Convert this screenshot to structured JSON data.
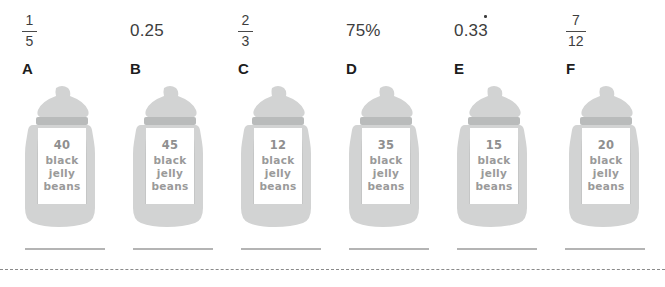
{
  "worksheet": {
    "values": [
      {
        "id": "value-1",
        "kind": "fraction",
        "numerator": "1",
        "denominator": "5",
        "text": "1/5"
      },
      {
        "id": "value-2",
        "kind": "decimal",
        "text": "0.25"
      },
      {
        "id": "value-3",
        "kind": "fraction",
        "numerator": "2",
        "denominator": "3",
        "text": "2/3"
      },
      {
        "id": "value-4",
        "kind": "percent",
        "text": "75%"
      },
      {
        "id": "value-5",
        "kind": "recurring-decimal",
        "text": "0.33",
        "recurring": true
      },
      {
        "id": "value-6",
        "kind": "fraction",
        "numerator": "7",
        "denominator": "12",
        "text": "7/12"
      }
    ],
    "letters": [
      "A",
      "B",
      "C",
      "D",
      "E",
      "F"
    ],
    "jars": [
      {
        "letter": "A",
        "count": "40",
        "line1": "black",
        "line2": "jelly",
        "line3": "beans"
      },
      {
        "letter": "B",
        "count": "45",
        "line1": "black",
        "line2": "jelly",
        "line3": "beans"
      },
      {
        "letter": "C",
        "count": "12",
        "line1": "black",
        "line2": "jelly",
        "line3": "beans"
      },
      {
        "letter": "D",
        "count": "35",
        "line1": "black",
        "line2": "jelly",
        "line3": "beans"
      },
      {
        "letter": "E",
        "count": "15",
        "line1": "black",
        "line2": "jelly",
        "line3": "beans"
      },
      {
        "letter": "F",
        "count": "20",
        "line1": "black",
        "line2": "jelly",
        "line3": "beans"
      }
    ],
    "answer_lines": 6,
    "colors": {
      "jar_glass": "#d2d3d3",
      "jar_lid": "#cfd0d0",
      "jar_band": "#b9bbbb",
      "label_text": "#9a9a9a",
      "letter_text": "#1d1d1d",
      "value_text": "#3d3d3d",
      "answer_line": "#b4b4b4",
      "cut_line": "#8a8a8a"
    }
  }
}
